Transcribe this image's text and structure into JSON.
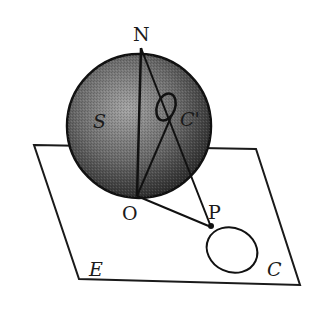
{
  "diagram": {
    "type": "stereographic-projection",
    "labels": {
      "north_pole": "N",
      "sphere": "S",
      "small_circle_on_sphere": "C'",
      "south_point": "O",
      "projected_point": "P",
      "plane": "E",
      "projected_circle": "C"
    },
    "colors": {
      "sphere_fill_light": "#9a9a9a",
      "sphere_fill_dark": "#2e2e2e",
      "stroke": "#1a1a1a",
      "background": "#ffffff"
    }
  }
}
